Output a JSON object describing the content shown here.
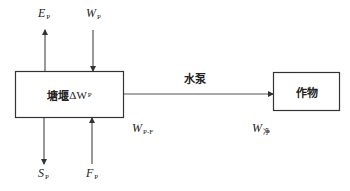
{
  "diagram": {
    "type": "water-balance-flow",
    "nodes": {
      "pond": {
        "label_cn": "塘堰",
        "label_var": "ΔW",
        "label_sub": "P"
      },
      "crop": {
        "label": "作物"
      }
    },
    "edges": {
      "pump": {
        "label": "水泵"
      },
      "evaporation": {
        "var": "E",
        "sub": "P"
      },
      "inflow": {
        "var": "W",
        "sub": "P"
      },
      "seepage": {
        "var": "S",
        "sub": "P"
      },
      "supply": {
        "var": "F",
        "sub": "P"
      },
      "transfer": {
        "var": "W",
        "sub": "P-F"
      },
      "net": {
        "var": "W",
        "sub": "净"
      }
    },
    "colors": {
      "stroke": "#333333",
      "background": "#ffffff"
    }
  }
}
